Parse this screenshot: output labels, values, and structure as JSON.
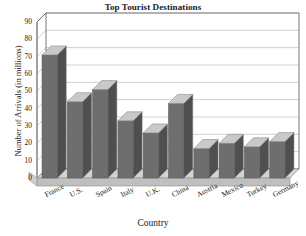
{
  "chart_data": {
    "type": "bar",
    "title": "Top Tourist Destinations",
    "xlabel": "Country",
    "ylabel": "Number of Arrivals (in millions)",
    "categories": [
      "France",
      "U.S.",
      "Spain",
      "Italy",
      "U.K.",
      "China",
      "Austria",
      "Mexico",
      "Turkey",
      "Germany"
    ],
    "values": [
      71,
      44,
      51,
      33,
      26,
      43,
      17,
      20,
      18,
      21
    ],
    "ylim": [
      0,
      90
    ],
    "yticks": [
      0,
      10,
      20,
      30,
      40,
      50,
      60,
      70,
      80,
      90
    ],
    "ytick_labels": [
      "0",
      "10",
      "20",
      "30",
      "40",
      "50",
      "60",
      "70",
      "80",
      "90"
    ],
    "grid": true,
    "legend": "none",
    "style": "3d-column",
    "bar_color": "#6e6e6e",
    "bar_top_color": "#c9c9c9",
    "bar_side_color": "#4f4f4f",
    "floor_color": "#c4c4c4",
    "plot_bg": "#ffffff",
    "axis_color": "#555555",
    "grid_color": "#bdbdbd"
  },
  "axes": {
    "y_ticks": [
      {
        "label": "90",
        "value": 90
      },
      {
        "label": "80",
        "value": 80
      },
      {
        "label": "70",
        "value": 70
      },
      {
        "label": "60",
        "value": 60
      },
      {
        "label": "50",
        "value": 50
      },
      {
        "label": "40",
        "value": 40
      },
      {
        "label": "30",
        "value": 30
      },
      {
        "label": "20",
        "value": 20
      },
      {
        "label": "10",
        "value": 10
      },
      {
        "label": "0",
        "value": 0
      }
    ],
    "x_ticks": [
      {
        "label": "France"
      },
      {
        "label": "U.S."
      },
      {
        "label": "Spain"
      },
      {
        "label": "Italy"
      },
      {
        "label": "U.K."
      },
      {
        "label": "China"
      },
      {
        "label": "Austria"
      },
      {
        "label": "Mexico"
      },
      {
        "label": "Turkey"
      },
      {
        "label": "Germany"
      }
    ]
  }
}
